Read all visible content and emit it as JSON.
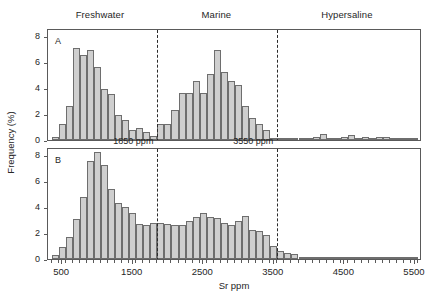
{
  "figure": {
    "zones": [
      {
        "label": "Freshwater",
        "center_x": 1050
      },
      {
        "label": "Marine",
        "center_x": 2700
      },
      {
        "label": "Hypersaline",
        "center_x": 4550
      }
    ],
    "axis": {
      "x_title": "Sr ppm",
      "y_title": "Frequency (%)"
    }
  },
  "chart_data": {
    "type": "bar",
    "title": "",
    "subtitle": "",
    "xlabel": "Sr ppm",
    "ylabel": "Frequency (%)",
    "xlim": [
      300,
      5600
    ],
    "ylim": [
      0,
      8.6
    ],
    "grid": false,
    "legend_position": "none",
    "bin_width": 100,
    "x_ticks": [
      500,
      1500,
      2500,
      3500,
      4500,
      5500
    ],
    "x_tick_labels": [
      "500",
      "1500",
      "2500",
      "3500",
      "4500",
      "5500"
    ],
    "y_ticks": [
      0,
      2,
      4,
      6,
      8
    ],
    "y_tick_labels": [
      "0",
      "2",
      "4",
      "6",
      "8"
    ],
    "zone_boundaries": [
      {
        "value": 1850,
        "label": "1850 ppm"
      },
      {
        "value": 3550,
        "label": "3550 ppm"
      }
    ],
    "panels": [
      {
        "id": "A",
        "label": "A",
        "bin_starts": [
          350,
          450,
          550,
          650,
          750,
          850,
          950,
          1050,
          1150,
          1250,
          1350,
          1450,
          1550,
          1650,
          1750,
          1850,
          1950,
          2050,
          2150,
          2250,
          2350,
          2450,
          2550,
          2650,
          2750,
          2850,
          2950,
          3050,
          3150,
          3250,
          3350,
          3450,
          3550,
          3650,
          3750,
          3850,
          3950,
          4050,
          4150,
          4250,
          4350,
          4450,
          4550,
          4650,
          4750,
          4850,
          4950,
          5050,
          5150,
          5250,
          5350,
          5450
        ],
        "values": [
          0.2,
          1.2,
          2.65,
          7.1,
          6.55,
          6.95,
          5.6,
          3.9,
          3.55,
          1.9,
          1.55,
          0.75,
          0.9,
          0.65,
          0.3,
          1.2,
          1.2,
          2.3,
          3.6,
          3.6,
          4.55,
          3.6,
          5.1,
          6.9,
          5.25,
          4.5,
          4.25,
          2.6,
          1.7,
          1.2,
          0.8,
          0.08,
          0.05,
          0.05,
          0.05,
          0.1,
          0.1,
          0.2,
          0.45,
          0.05,
          0.05,
          0.2,
          0.4,
          0.15,
          0.2,
          0.18,
          0.25,
          0.22,
          0.05,
          0.1,
          0.08,
          0.1
        ]
      },
      {
        "id": "B",
        "label": "B",
        "bin_starts": [
          350,
          450,
          550,
          650,
          750,
          850,
          950,
          1050,
          1150,
          1250,
          1350,
          1450,
          1550,
          1650,
          1750,
          1850,
          1950,
          2050,
          2150,
          2250,
          2350,
          2450,
          2550,
          2650,
          2750,
          2850,
          2950,
          3050,
          3150,
          3250,
          3350,
          3450,
          3550,
          3650,
          3750,
          3850,
          3950,
          4050,
          4150,
          4250,
          4350,
          4450,
          4550,
          4650,
          4750,
          4850,
          4950,
          5050,
          5150,
          5250,
          5350,
          5450
        ],
        "values": [
          0.3,
          0.9,
          1.7,
          3.1,
          4.8,
          7.5,
          8.25,
          7.2,
          5.35,
          4.3,
          4.0,
          3.5,
          2.7,
          2.65,
          2.75,
          2.8,
          2.7,
          2.6,
          2.65,
          2.95,
          3.2,
          3.55,
          3.2,
          3.15,
          2.8,
          2.65,
          2.9,
          3.3,
          2.25,
          2.15,
          1.85,
          1.0,
          0.65,
          0.5,
          0.42,
          0.08,
          0.05,
          0.05,
          0.12,
          0.05,
          0.05,
          0.1,
          0.12,
          0.05,
          0.1,
          0.1,
          0.1,
          0.1,
          0.05,
          0.08,
          0.08,
          0.1
        ]
      }
    ]
  }
}
